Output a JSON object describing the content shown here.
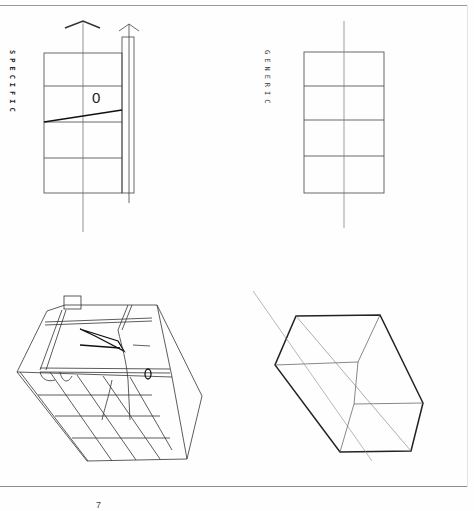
{
  "sheet": {
    "title_left": "SPECIFIC",
    "title_right": "GENERIC",
    "section_mark": "0",
    "page_mark": "7"
  },
  "panels": [
    {
      "id": "specific-plan",
      "description": "plan/section with four stacked bays, axis line, vertical shaft with arrow, sloped wedge line marked 0"
    },
    {
      "id": "generic-plan",
      "description": "plan/section with four stacked bays and central axis line"
    },
    {
      "id": "specific-axonometric",
      "description": "axonometric wireframe of building volume with floors, ramps and internal elements"
    },
    {
      "id": "generic-axonometric",
      "description": "axonometric of plain box volume with diagonal axis line"
    }
  ],
  "colors": {
    "ink": "#222222",
    "light_ink": "#777777",
    "paper": "#fefefe",
    "rule": "#9a9a9a"
  }
}
